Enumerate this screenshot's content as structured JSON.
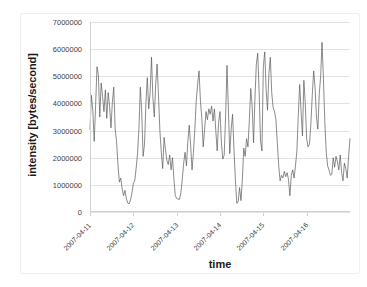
{
  "chart_data": {
    "type": "line",
    "title": "",
    "xlabel": "time",
    "ylabel": "intensity [bytes/second]",
    "grid": true,
    "legend": "none",
    "ylim": [
      0,
      7000000
    ],
    "ytick_labels": [
      "7000000",
      "6000000",
      "5000000",
      "4000000",
      "3000000",
      "2000000",
      "1000000",
      "0"
    ],
    "ytick_values": [
      7000000,
      6000000,
      5000000,
      4000000,
      3000000,
      2000000,
      1000000,
      0
    ],
    "xtick_labels": [
      "2007-04-11",
      "2007-04-12",
      "2007-04-13",
      "2007-04-14",
      "2007-04-15",
      "2007-04-16"
    ],
    "xlim_labels": [
      "2007-04-11",
      "2007-04-17"
    ],
    "series": [
      {
        "name": "intensity",
        "color": "#595959",
        "values": [
          3050000,
          4300000,
          3750000,
          2600000,
          3900000,
          5350000,
          5050000,
          3500000,
          4750000,
          4250000,
          3700000,
          4500000,
          3450000,
          4400000,
          3900000,
          3100000,
          4050000,
          4600000,
          3050000,
          2600000,
          1750000,
          1100000,
          1250000,
          850000,
          600000,
          800000,
          500000,
          330000,
          300000,
          450000,
          700000,
          1050000,
          1150000,
          1600000,
          2150000,
          3050000,
          4600000,
          3650000,
          2050000,
          2500000,
          4000000,
          4950000,
          3800000,
          4400000,
          5700000,
          4200000,
          3500000,
          4700000,
          5450000,
          4300000,
          3000000,
          2200000,
          1600000,
          2750000,
          2300000,
          1900000,
          1750000,
          2100000,
          1550000,
          2000000,
          1250000,
          600000,
          500000,
          480000,
          460000,
          700000,
          1200000,
          1800000,
          2200000,
          1700000,
          2600000,
          3200000,
          2450000,
          1550000,
          2200000,
          3050000,
          4100000,
          4700000,
          5200000,
          4100000,
          3450000,
          2400000,
          3050000,
          3700000,
          3400000,
          3800000,
          3600000,
          3900000,
          3350000,
          3800000,
          3000000,
          2250000,
          3300000,
          3700000,
          2550000,
          1950000,
          2100000,
          3500000,
          5400000,
          3800000,
          2150000,
          3050000,
          3600000,
          2300000,
          1200000,
          320000,
          380000,
          900000,
          420000,
          1200000,
          2350000,
          2050000,
          2700000,
          2400000,
          3400000,
          4550000,
          3900000,
          2550000,
          4200000,
          5450000,
          5850000,
          4400000,
          2600000,
          2250000,
          5350000,
          5900000,
          4500000,
          3750000,
          5100000,
          5700000,
          4400000,
          3850000,
          3700000,
          3400000,
          2550000,
          1700000,
          1150000,
          1350000,
          1250000,
          1500000,
          1300000,
          1450000,
          1200000,
          600000,
          1350000,
          1550000,
          1250000,
          1700000,
          2250000,
          3550000,
          4700000,
          3700000,
          2800000,
          4850000,
          4000000,
          2700000,
          2400000,
          2500000,
          3250000,
          4300000,
          5200000,
          4600000,
          3500000,
          3050000,
          4350000,
          5000000,
          6250000,
          4900000,
          3300000,
          2200000,
          1700000,
          1550000,
          1350000,
          1400000,
          2000000,
          1650000,
          2050000,
          1850000,
          1550000,
          2100000,
          1450000,
          1150000,
          1800000,
          1600000,
          1250000,
          2050000,
          2700000
        ]
      }
    ]
  }
}
